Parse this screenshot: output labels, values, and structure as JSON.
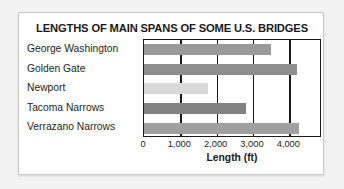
{
  "chart_data": {
    "type": "bar",
    "orientation": "horizontal",
    "title": "LENGTHS OF MAIN SPANS OF SOME U.S. BRIDGES",
    "xlabel": "Length (ft)",
    "ylabel": "",
    "categories": [
      "George Washington",
      "Golden Gate",
      "Newport",
      "Tacoma Narrows",
      "Verrazano Narrows"
    ],
    "values": [
      3500,
      4200,
      1750,
      2800,
      4260
    ],
    "bar_colors": [
      "#9a9a9a",
      "#8e8e8e",
      "#d9d9d9",
      "#828282",
      "#a0a0a0"
    ],
    "xlim": [
      0,
      4900
    ],
    "xticks": [
      0,
      1000,
      2000,
      3000,
      4000
    ],
    "xtick_labels": [
      "0",
      "1,000",
      "2,000",
      "3,000",
      "4,000"
    ],
    "grid": "vertical",
    "legend": "none"
  },
  "style": {
    "frame_color": "#1a1a1a",
    "text_color": "#231f20",
    "card_background": "#ffffff",
    "page_background": "#f2f2f2"
  }
}
